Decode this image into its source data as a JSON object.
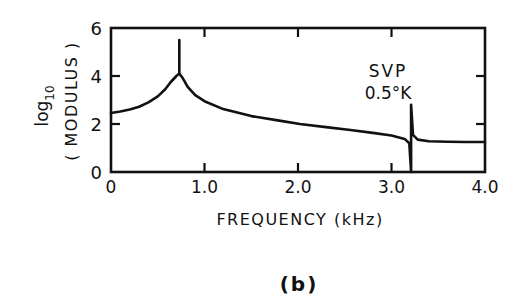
{
  "chart_data": {
    "type": "line",
    "title": "",
    "panel_label": "(b)",
    "xlabel": "FREQUENCY (kHz)",
    "ylabel": "log10 (MODULUS)",
    "ylabel_parts": {
      "line1": "log",
      "line1_sub": "10",
      "line2": "( MODULUS )"
    },
    "xlim": [
      0,
      4.0
    ],
    "ylim": [
      0,
      6
    ],
    "xticks": [
      0,
      1.0,
      2.0,
      3.0,
      4.0
    ],
    "xtick_labels": [
      "0",
      "1.0",
      "2.0",
      "3.0",
      "4.0"
    ],
    "yticks": [
      0,
      2,
      4,
      6
    ],
    "ytick_labels": [
      "0",
      "2",
      "4",
      "6"
    ],
    "grid": false,
    "legend": null,
    "annotations": [
      {
        "text_line1": "SVP",
        "text_line2": "0.5°K",
        "x": 3.21,
        "y": 2.8
      }
    ],
    "series": [
      {
        "name": "log10 modulus",
        "color": "#111111",
        "points": [
          [
            0.0,
            2.46
          ],
          [
            0.1,
            2.52
          ],
          [
            0.2,
            2.6
          ],
          [
            0.3,
            2.72
          ],
          [
            0.4,
            2.9
          ],
          [
            0.5,
            3.15
          ],
          [
            0.58,
            3.45
          ],
          [
            0.64,
            3.75
          ],
          [
            0.7,
            4.0
          ],
          [
            0.73,
            4.1
          ],
          [
            0.73,
            5.5
          ],
          [
            0.73,
            4.1
          ],
          [
            0.76,
            3.95
          ],
          [
            0.82,
            3.55
          ],
          [
            0.9,
            3.2
          ],
          [
            1.0,
            2.95
          ],
          [
            1.2,
            2.62
          ],
          [
            1.5,
            2.33
          ],
          [
            1.8,
            2.14
          ],
          [
            2.02,
            2.0
          ],
          [
            2.3,
            1.87
          ],
          [
            2.56,
            1.75
          ],
          [
            2.8,
            1.63
          ],
          [
            3.0,
            1.52
          ],
          [
            3.14,
            1.38
          ],
          [
            3.19,
            1.2
          ],
          [
            3.21,
            0.0
          ],
          [
            3.21,
            2.8
          ],
          [
            3.23,
            1.55
          ],
          [
            3.28,
            1.35
          ],
          [
            3.4,
            1.28
          ],
          [
            3.6,
            1.26
          ],
          [
            3.8,
            1.25
          ],
          [
            4.0,
            1.25
          ]
        ]
      }
    ]
  }
}
